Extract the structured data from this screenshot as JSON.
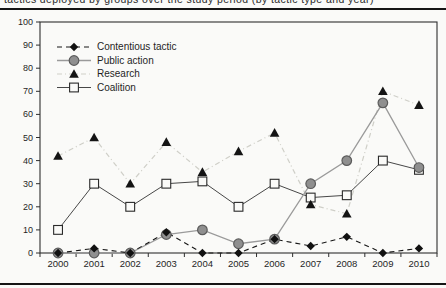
{
  "page": {
    "caption_fragment": "tactics deployed by groups over the study period (by tactic type and year)"
  },
  "chart_data": {
    "type": "line",
    "x": [
      2000,
      2001,
      2002,
      2003,
      2004,
      2005,
      2006,
      2007,
      2008,
      2009,
      2010
    ],
    "series": [
      {
        "name": "Contentious tactic",
        "marker": "diamond",
        "line_style": "dashed-black",
        "values": [
          0,
          2,
          0,
          9,
          0,
          0,
          6,
          3,
          7,
          0,
          2
        ]
      },
      {
        "name": "Public action",
        "marker": "circle",
        "line_style": "solid-gray",
        "values": [
          0,
          0,
          0,
          8,
          10,
          4,
          6,
          30,
          40,
          65,
          37
        ]
      },
      {
        "name": "Research",
        "marker": "triangle",
        "line_style": "dash-dot-light",
        "values": [
          42,
          50,
          30,
          48,
          35,
          44,
          52,
          21,
          17,
          70,
          64
        ]
      },
      {
        "name": "Coalition",
        "marker": "square",
        "line_style": "solid-dark",
        "values": [
          10,
          30,
          20,
          30,
          31,
          20,
          30,
          24,
          25,
          40,
          36
        ]
      }
    ],
    "ylim": [
      0,
      100
    ],
    "ytick_step": 10,
    "yticks": [
      0,
      10,
      20,
      30,
      40,
      50,
      60,
      70,
      80,
      90,
      100
    ],
    "grid": false,
    "legend_position": "top-left-inside",
    "xlabel": "",
    "ylabel": ""
  },
  "colors": {
    "ink": "#1f1f1f",
    "frame": "#2e2e2e",
    "rule": "#151515",
    "background": "#fafaf8",
    "contentious_line": "#161616",
    "diamond_fill": "#111111",
    "public_line": "#9a9a9a",
    "circle_fill": "#8f8f8f",
    "circle_stroke": "#5b5b5b",
    "research_line": "#cfcfc8",
    "triangle_fill": "#141414",
    "coalition_line": "#474747",
    "square_fill": "#fafaf8",
    "square_stroke": "#2a2a2a"
  }
}
